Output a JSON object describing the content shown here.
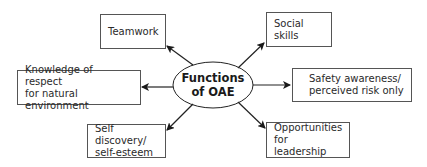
{
  "diagram": {
    "center": {
      "line1": "Functions",
      "line2": "of OAE"
    },
    "nodes": [
      {
        "id": "teamwork",
        "line1": "Teamwork",
        "line2": ""
      },
      {
        "id": "social-skills",
        "line1": "Social skills",
        "line2": ""
      },
      {
        "id": "knowledge-respect",
        "line1": "Knowledge of respect",
        "line2": "for natural environment"
      },
      {
        "id": "safety-awareness",
        "line1": "Safety awareness/",
        "line2": "perceived risk only"
      },
      {
        "id": "self-discovery",
        "line1": "Self discovery/",
        "line2": "self-esteem"
      },
      {
        "id": "opportunities-leadership",
        "line1": "Opportunities",
        "line2": "for leadership"
      }
    ],
    "colors": {
      "stroke": "#222222",
      "box_border": "#555555",
      "text": "#2a2a2a"
    }
  }
}
